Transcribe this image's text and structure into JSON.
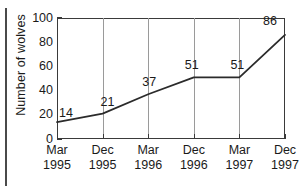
{
  "chart_data": {
    "type": "line",
    "title": "",
    "subtitle": "",
    "xlabel": "",
    "ylabel": "Number of wolves",
    "categories": [
      "Mar 1995",
      "Dec 1995",
      "Mar 1996",
      "Dec 1996",
      "Mar 1997",
      "Dec 1997"
    ],
    "x_tick_months": [
      "Mar",
      "Dec",
      "Mar",
      "Dec",
      "Mar",
      "Dec"
    ],
    "x_tick_years": [
      "1995",
      "1995",
      "1996",
      "1996",
      "1997",
      "1997"
    ],
    "values": [
      14,
      21,
      37,
      51,
      51,
      86
    ],
    "point_labels": [
      "14",
      "21",
      "37",
      "51",
      "51",
      "86"
    ],
    "ylim": [
      0,
      100
    ],
    "y_ticks": [
      0,
      20,
      40,
      60,
      80,
      100
    ],
    "y_tick_labels": [
      "0",
      "20",
      "40",
      "60",
      "80",
      "100"
    ],
    "grid": "vertical",
    "legend": "none",
    "series": [
      {
        "name": "Number of wolves",
        "values": [
          14,
          21,
          37,
          51,
          51,
          86
        ],
        "color": "#2b2b2b"
      }
    ]
  },
  "colors": {
    "line": "#2b2b2b",
    "frame": "#3a3a3a",
    "gridline": "#9a9a9a",
    "text": "#1a1a1a",
    "background": "#ffffff",
    "left_rule": "#4a4a4a"
  }
}
